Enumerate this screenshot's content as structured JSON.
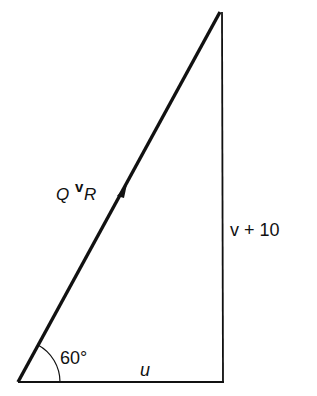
{
  "diagram": {
    "type": "vector-triangle",
    "vertices": {
      "origin": [
        18,
        382
      ],
      "top": [
        220,
        12
      ],
      "right_angle": [
        224,
        382
      ]
    },
    "labels": {
      "hypotenuse": {
        "main": "Q",
        "superscript": "v",
        "subscript": "R"
      },
      "vertical_side": "v + 10",
      "base": "u",
      "angle": "60°"
    },
    "angle_degrees": 60,
    "stroke_color": "#111111",
    "background": "#ffffff"
  }
}
